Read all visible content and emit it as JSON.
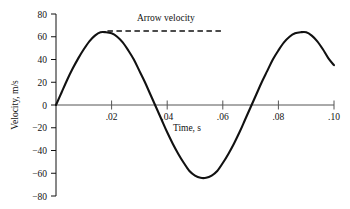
{
  "chart_data": {
    "type": "line",
    "title": "",
    "xlabel": "Time, s",
    "ylabel": "Velocity, m/s",
    "xlim": [
      0,
      0.1
    ],
    "ylim": [
      -80,
      80
    ],
    "grid": false,
    "legend": "none",
    "x_ticks": [
      {
        "value": 0.02,
        "label": ".02"
      },
      {
        "value": 0.04,
        "label": ".04"
      },
      {
        "value": 0.06,
        "label": ".06"
      },
      {
        "value": 0.08,
        "label": ".08"
      },
      {
        "value": 0.1,
        "label": ".10"
      }
    ],
    "y_ticks": [
      {
        "value": 80,
        "label": "80"
      },
      {
        "value": 60,
        "label": "60"
      },
      {
        "value": 40,
        "label": "40"
      },
      {
        "value": 20,
        "label": "20"
      },
      {
        "value": 0,
        "label": "0"
      },
      {
        "value": -20,
        "label": "−20"
      },
      {
        "value": -40,
        "label": "−40"
      },
      {
        "value": -60,
        "label": "−60"
      },
      {
        "value": -80,
        "label": "−80"
      }
    ],
    "series": [
      {
        "name": "Bowstring velocity",
        "style": "solid",
        "color": "#111111",
        "x": [
          0.0,
          0.002,
          0.004,
          0.006,
          0.008,
          0.01,
          0.012,
          0.014,
          0.016,
          0.018,
          0.02,
          0.022,
          0.024,
          0.026,
          0.028,
          0.03,
          0.032,
          0.034,
          0.036,
          0.038,
          0.04,
          0.042,
          0.044,
          0.046,
          0.048,
          0.05,
          0.052,
          0.054,
          0.056,
          0.058,
          0.06,
          0.062,
          0.064,
          0.066,
          0.068,
          0.07,
          0.072,
          0.074,
          0.076,
          0.078,
          0.08,
          0.082,
          0.084,
          0.086,
          0.088,
          0.09,
          0.092,
          0.094,
          0.096,
          0.098,
          0.1
        ],
        "y": [
          0,
          11,
          22,
          32,
          41,
          49,
          56,
          61,
          64,
          64,
          63,
          60,
          55,
          48,
          40,
          30,
          20,
          9,
          -2,
          -13,
          -24,
          -34,
          -43,
          -51,
          -58,
          -62,
          -64,
          -64,
          -62,
          -58,
          -51,
          -43,
          -34,
          -24,
          -13,
          -2,
          9,
          20,
          30,
          40,
          48,
          55,
          60,
          63,
          64,
          64,
          61,
          56,
          49,
          41,
          35
        ]
      },
      {
        "name": "Arrow velocity",
        "style": "dashed",
        "color": "#111111",
        "x": [
          0.0185,
          0.0605
        ],
        "y": [
          65,
          65
        ]
      }
    ],
    "annotations": [
      {
        "text": "Arrow velocity",
        "x": 0.0395,
        "y": 74
      }
    ],
    "peaks": [
      {
        "x": 0.017,
        "y": 64
      },
      {
        "x": 0.089,
        "y": 65
      }
    ],
    "troughs": [
      {
        "x": 0.053,
        "y": -63
      }
    ],
    "zero_crossings": [
      0.0,
      0.0357,
      0.0715
    ],
    "period_s": 0.0715,
    "amplitude_m_s": 64
  },
  "axes": {
    "x_axis_name": "time-axis",
    "y_axis_name": "velocity-axis"
  }
}
